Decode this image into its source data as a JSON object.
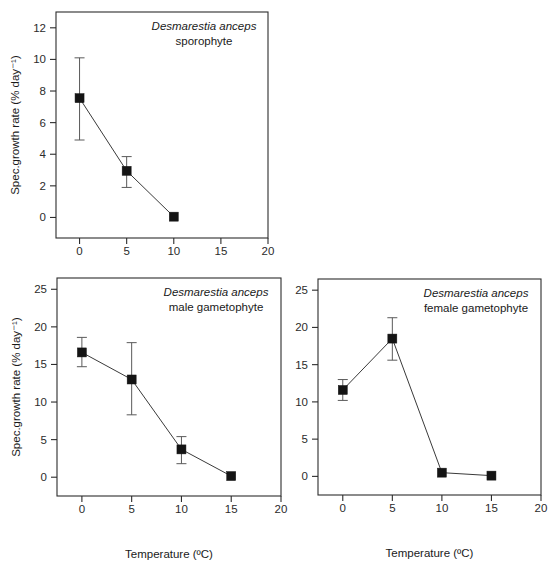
{
  "figure": {
    "species": "Desmarestia anceps",
    "axis_x_title": "Temperature (ºC)",
    "axis_y_title": "Spec.growth rate (% day⁻¹)"
  },
  "chart_data": [
    {
      "id": "sporophyte",
      "type": "line",
      "title": "Desmarestia anceps",
      "subtitle": "sporophyte",
      "xlabel": "Temperature (ºC)",
      "ylabel": "Spec.growth rate (% day⁻¹)",
      "xlim": [
        -2.5,
        20
      ],
      "ylim": [
        -1.3,
        13
      ],
      "xticks": [
        0,
        5,
        10,
        15,
        20
      ],
      "yticks": [
        0,
        2,
        4,
        6,
        8,
        10,
        12
      ],
      "grid": false,
      "legend": "none",
      "x": [
        0,
        5,
        10
      ],
      "values": [
        7.55,
        2.95,
        0.05
      ],
      "err_low": [
        4.9,
        1.9,
        0.05
      ],
      "err_high": [
        10.1,
        3.85,
        0.05
      ]
    },
    {
      "id": "male-gametophyte",
      "type": "line",
      "title": "Desmarestia anceps",
      "subtitle": "male gametophyte",
      "xlabel": "Temperature (ºC)",
      "ylabel": "Spec.growth rate (% day⁻¹)",
      "xlim": [
        -2.5,
        20
      ],
      "ylim": [
        -2.5,
        26.5
      ],
      "xticks": [
        0,
        5,
        10,
        15,
        20
      ],
      "yticks": [
        0,
        5,
        10,
        15,
        20,
        25
      ],
      "grid": false,
      "legend": "none",
      "x": [
        0,
        5,
        10,
        15
      ],
      "values": [
        16.6,
        13.0,
        3.7,
        0.15
      ],
      "err_low": [
        14.7,
        8.3,
        1.8,
        0.15
      ],
      "err_high": [
        18.6,
        17.9,
        5.4,
        0.15
      ]
    },
    {
      "id": "female-gametophyte",
      "type": "line",
      "title": "Desmarestia anceps",
      "subtitle": "female gametophyte",
      "xlabel": "Temperature (ºC)",
      "ylabel": "",
      "xlim": [
        -2.5,
        20
      ],
      "ylim": [
        -2.5,
        26.5
      ],
      "xticks": [
        0,
        5,
        10,
        15,
        20
      ],
      "yticks": [
        0,
        5,
        10,
        15,
        20,
        25
      ],
      "grid": false,
      "legend": "none",
      "x": [
        0,
        5,
        10,
        15
      ],
      "values": [
        11.6,
        18.5,
        0.5,
        0.1
      ],
      "err_low": [
        10.2,
        15.6,
        0.5,
        0.1
      ],
      "err_high": [
        13.0,
        21.3,
        0.5,
        0.1
      ]
    }
  ],
  "colors": {
    "marker": "#141414",
    "line": "#3a3a3a",
    "errorbar": "#5a5a5a",
    "axis": "#2c2c2c",
    "background": "#ffffff"
  }
}
